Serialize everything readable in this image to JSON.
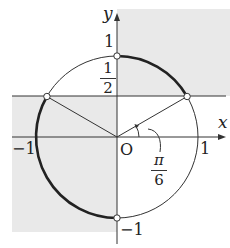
{
  "diagram": {
    "type": "unit-circle",
    "axes": {
      "x_label": "x",
      "y_label": "y",
      "origin_label": "O"
    },
    "ticks": {
      "y_top": "1",
      "y_bottom": "−1",
      "x_left": "−1",
      "x_right": "1"
    },
    "half_line": {
      "numerator": "1",
      "denominator": "2"
    },
    "angle": {
      "numerator": "π",
      "denominator": "6"
    },
    "colors": {
      "shade": "#e9e9e9",
      "stroke": "#333333",
      "background": "#ffffff"
    }
  }
}
